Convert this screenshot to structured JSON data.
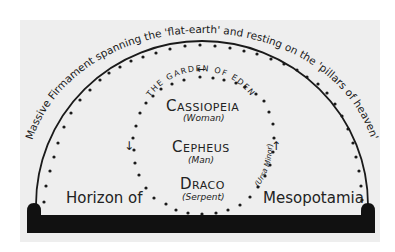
{
  "diagram": {
    "firmament_caption": "Massive Firmament spanning the 'flat-earth' and resting on the 'pillars of heaven'",
    "garden_label": "THE GARDEN OF EDEN",
    "ursa_minor_label": "(Ursa Minor)",
    "horizon": {
      "left": "Horizon of",
      "right": "Mesopotamia"
    },
    "constellations": [
      {
        "name": "Cassiopeia",
        "subtitle": "(Woman)"
      },
      {
        "name": "Cepheus",
        "subtitle": "(Man)"
      },
      {
        "name": "Draco",
        "subtitle": "(Serpent)"
      }
    ],
    "arrows": {
      "top": "←",
      "left": "↓",
      "right": "↑"
    },
    "colors": {
      "ink": "#1a1a1a",
      "panel": "#eeeeee",
      "ground": "#111111",
      "background": "#ffffff"
    }
  }
}
